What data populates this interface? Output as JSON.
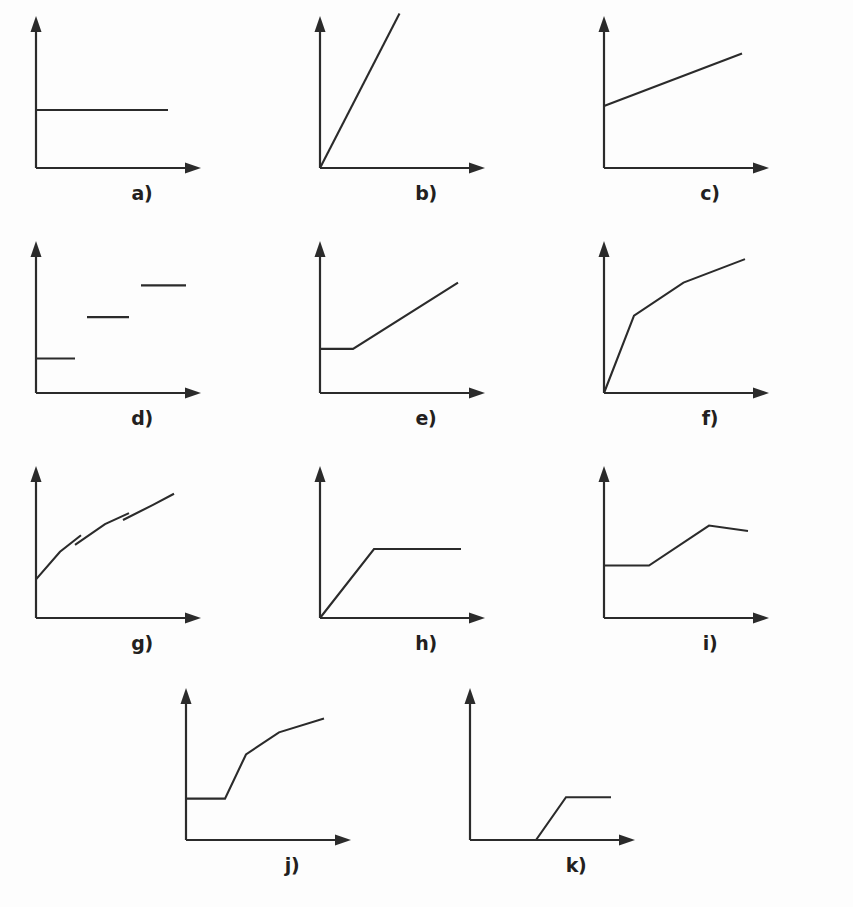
{
  "figure": {
    "background_color": "#fdfdfd",
    "ink_color": "#2b2b2b",
    "label_color": "#231f20",
    "columns": 3,
    "rows": 4
  },
  "chart_data": {
    "type": "line",
    "title": "",
    "xlabel": "",
    "ylabel": "",
    "axis_style": "arrow-tipped L-shaped axes, no tick marks, no gridlines, no numeric scales",
    "grid": false,
    "legend": false,
    "xlim": [
      0,
      1
    ],
    "ylim": [
      0,
      1
    ],
    "panels": [
      {
        "label": "a)",
        "shape": "constant",
        "description": "Flat horizontal line at constant level starting from the y-axis",
        "segments": [
          [
            [
              0.0,
              0.42
            ],
            [
              0.88,
              0.42
            ]
          ]
        ]
      },
      {
        "label": "b)",
        "shape": "linear-steep-from-origin",
        "description": "Steep straight line rising from the origin, extending above the y-axis arrow",
        "segments": [
          [
            [
              0.0,
              0.0
            ],
            [
              0.53,
              1.12
            ]
          ]
        ]
      },
      {
        "label": "c)",
        "shape": "linear-positive-intercept",
        "description": "Gently rising straight line starting at a positive y-intercept",
        "segments": [
          [
            [
              0.0,
              0.45
            ],
            [
              0.92,
              0.83
            ]
          ]
        ]
      },
      {
        "label": "d)",
        "shape": "step-function",
        "description": "Three disconnected horizontal step segments at increasing levels",
        "segments": [
          [
            [
              0.0,
              0.25
            ],
            [
              0.26,
              0.25
            ]
          ],
          [
            [
              0.34,
              0.55
            ],
            [
              0.62,
              0.55
            ]
          ],
          [
            [
              0.7,
              0.78
            ],
            [
              1.0,
              0.78
            ]
          ]
        ]
      },
      {
        "label": "e)",
        "shape": "flat-then-linear-rise",
        "description": "Flat from the y-axis, then a knee and a steady linear rise",
        "segments": [
          [
            [
              0.0,
              0.32
            ],
            [
              0.22,
              0.32
            ],
            [
              0.92,
              0.8
            ]
          ]
        ]
      },
      {
        "label": "f)",
        "shape": "concave-saturating",
        "description": "Very steep rise from the origin then two progressively flatter segments",
        "segments": [
          [
            [
              0.0,
              0.0
            ],
            [
              0.2,
              0.56
            ],
            [
              0.53,
              0.8
            ],
            [
              0.94,
              0.97
            ]
          ]
        ]
      },
      {
        "label": "g)",
        "shape": "discontinuous-increasing",
        "description": "Concave rising curve broken into three arcs with downward jump discontinuities",
        "segments": [
          [
            [
              0.0,
              0.28
            ],
            [
              0.16,
              0.48
            ],
            [
              0.3,
              0.6
            ]
          ],
          [
            [
              0.26,
              0.53
            ],
            [
              0.46,
              0.68
            ],
            [
              0.62,
              0.76
            ]
          ],
          [
            [
              0.58,
              0.71
            ],
            [
              0.78,
              0.82
            ],
            [
              0.92,
              0.9
            ]
          ]
        ]
      },
      {
        "label": "h)",
        "shape": "linear-then-plateau",
        "description": "Linear rise from the origin that saturates into a flat plateau",
        "segments": [
          [
            [
              0.0,
              0.0
            ],
            [
              0.36,
              0.5
            ],
            [
              0.94,
              0.5
            ]
          ]
        ]
      },
      {
        "label": "i)",
        "shape": "flat-ramp-declining-plateau",
        "description": "Flat, then a ramp up, then a slightly declining plateau",
        "segments": [
          [
            [
              0.0,
              0.38
            ],
            [
              0.3,
              0.38
            ],
            [
              0.7,
              0.67
            ],
            [
              0.96,
              0.63
            ]
          ]
        ]
      },
      {
        "label": "j)",
        "shape": "sigmoid",
        "description": "Flat, then a steep rise, then progressively flattening S-shaped curve",
        "segments": [
          [
            [
              0.0,
              0.3
            ],
            [
              0.26,
              0.3
            ],
            [
              0.4,
              0.62
            ],
            [
              0.62,
              0.78
            ],
            [
              0.92,
              0.88
            ]
          ]
        ]
      },
      {
        "label": "k)",
        "shape": "dead-zone-then-plateau",
        "description": "Zero along the x-axis, then a delayed ramp, then a flat plateau",
        "segments": [
          [
            [
              0.0,
              0.0
            ],
            [
              0.44,
              0.0
            ],
            [
              0.64,
              0.31
            ],
            [
              0.94,
              0.31
            ]
          ]
        ]
      }
    ]
  }
}
